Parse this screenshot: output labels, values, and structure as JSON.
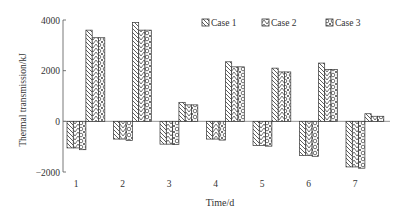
{
  "chart_data": {
    "type": "bar",
    "title": "",
    "xlabel": "Time/d",
    "ylabel": "Thermal transmission/kJ",
    "ylim": [
      -2000,
      4000
    ],
    "yticks": [
      -2000,
      0,
      2000,
      4000
    ],
    "ytick_labels": [
      "−2000",
      "0",
      "2000",
      "4000"
    ],
    "categories": [
      "1",
      "2",
      "3",
      "4",
      "5",
      "6",
      "7"
    ],
    "legend_position": "top-right",
    "series": [
      {
        "name": "Case 1",
        "pattern": "backslash-hatch",
        "negative": [
          -1050,
          -700,
          -900,
          -700,
          -950,
          -1350,
          -1800
        ],
        "positive": [
          3600,
          3900,
          750,
          2350,
          2100,
          2300,
          300
        ]
      },
      {
        "name": "Case 2",
        "pattern": "chevron-hatch",
        "negative": [
          -1050,
          -700,
          -900,
          -700,
          -950,
          -1350,
          -1800
        ],
        "positive": [
          3300,
          3600,
          650,
          2150,
          1950,
          2050,
          200
        ]
      },
      {
        "name": "Case 3",
        "pattern": "circle-check",
        "negative": [
          -1120,
          -750,
          -920,
          -740,
          -980,
          -1380,
          -1850
        ],
        "positive": [
          3300,
          3600,
          650,
          2150,
          1950,
          2050,
          200
        ]
      }
    ]
  }
}
